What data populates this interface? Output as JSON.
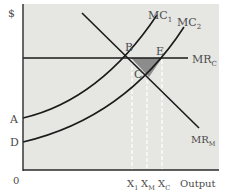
{
  "diagram": {
    "y_axis_label": "$",
    "x_axis_label": "Output",
    "origin_label": "0",
    "colors": {
      "panel": "#e6e6e3",
      "curve": "#1a1a1a",
      "shaded": "#8c8c8c",
      "guides": "#ffffff",
      "text": "#4a4a4a"
    },
    "curves": {
      "mc1": {
        "label": "MC",
        "sub": "1"
      },
      "mc2": {
        "label": "MC",
        "sub": "2"
      },
      "mrc": {
        "label": "MR",
        "sub": "C"
      },
      "mrm": {
        "label": "MR",
        "sub": "M"
      }
    },
    "points": {
      "A": "A",
      "D": "D",
      "B": "B",
      "E": "E",
      "C": "C"
    },
    "x_ticks": [
      {
        "label": "X",
        "sub": "1"
      },
      {
        "label": "X",
        "sub": "M"
      },
      {
        "label": "X",
        "sub": "C"
      }
    ]
  }
}
